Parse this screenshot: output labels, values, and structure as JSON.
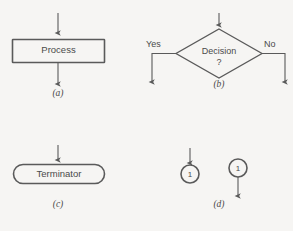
{
  "figure": {
    "background_color": "#f6f5f3",
    "stroke_color": "#5a5a5a",
    "text_color": "#4a4a4a"
  },
  "panels": [
    {
      "key": "a",
      "caption": "(a)",
      "symbol": "process",
      "label": "Process",
      "has_input_arrow": true,
      "has_output_arrow": true
    },
    {
      "key": "b",
      "caption": "(b)",
      "symbol": "decision",
      "label": "Decision",
      "question_mark": "?",
      "branch_left_label": "Yes",
      "branch_right_label": "No",
      "has_input_arrow": true
    },
    {
      "key": "c",
      "caption": "(c)",
      "symbol": "terminator",
      "label": "Terminator",
      "has_input_arrow": true,
      "has_output_arrow": false
    },
    {
      "key": "d",
      "caption": "(d)",
      "symbol": "connector",
      "connector_in": {
        "label": "1",
        "has_input_arrow": true
      },
      "connector_out": {
        "label": "1",
        "has_output_arrow": true
      }
    }
  ]
}
